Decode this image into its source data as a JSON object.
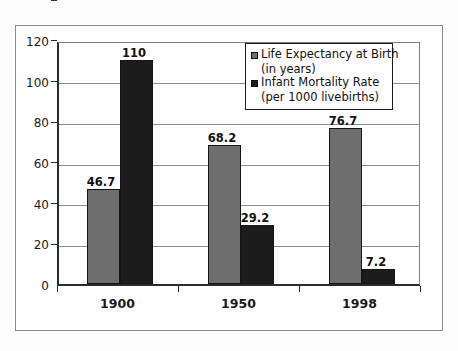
{
  "chart_data": {
    "type": "bar",
    "title": "",
    "subtitle": "",
    "xlabel": "",
    "ylabel": "",
    "categories": [
      "1900",
      "1950",
      "1998"
    ],
    "series": [
      {
        "name": "Life Expectancy at Birth",
        "name_line2": "(in years)",
        "color": "#6e6e6e",
        "values": [
          46.7,
          68.2,
          76.7
        ],
        "labels": [
          "46.7",
          "68.2",
          "76.7"
        ]
      },
      {
        "name": "Infant Mortality Rate",
        "name_line2": "(per 1000 livebirths)",
        "color": "#1c1c1c",
        "values": [
          110,
          29.2,
          7.2
        ],
        "labels": [
          "110",
          "29.2",
          "7.2"
        ]
      }
    ],
    "ylim": [
      0,
      120
    ],
    "ytick_values": [
      0,
      20,
      40,
      60,
      80,
      100,
      120
    ],
    "ytick_labels": [
      "0",
      "20",
      "40",
      "60",
      "80",
      "100",
      "120"
    ],
    "grid": true,
    "legend_position": "top-right"
  },
  "colors": {
    "series0": "#6e6e6e",
    "series1": "#1c1c1c",
    "axis": "#2b2b2b",
    "grid": "#8c8c8c",
    "frame": "#8a8a8a",
    "background": "#ffffff"
  }
}
